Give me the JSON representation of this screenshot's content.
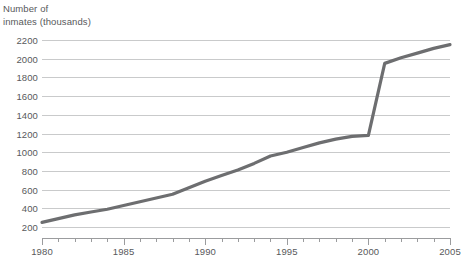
{
  "chart_data": {
    "type": "line",
    "title_line1": "Number of",
    "title_line2": "inmates (thousands)",
    "xlabel": "",
    "ylabel": "Number of inmates (thousands)",
    "xlim": [
      1980,
      2005
    ],
    "ylim": [
      150,
      2250
    ],
    "grid": true,
    "legend_position": "none",
    "line_color": "#6d6e70",
    "grid_color": "#c9cacb",
    "axis_color": "#9b9c9e",
    "text_color": "#58595b",
    "ytick_labels": [
      "2200",
      "2000",
      "1800",
      "1600",
      "1400",
      "1200",
      "1000",
      "800",
      "600",
      "400",
      "200"
    ],
    "ytick_values": [
      2200,
      2000,
      1800,
      1600,
      1400,
      1200,
      1000,
      800,
      600,
      400,
      200
    ],
    "xtick_labels": [
      "1980",
      "1985",
      "1990",
      "1995",
      "2000",
      "2005"
    ],
    "xtick_values": [
      1980,
      1985,
      1990,
      1995,
      2000,
      2005
    ],
    "xtick_minor_values": [
      1981,
      1982,
      1983,
      1984,
      1986,
      1987,
      1988,
      1989,
      1991,
      1992,
      1993,
      1994,
      1996,
      1997,
      1998,
      1999,
      2001,
      2002,
      2003,
      2004
    ],
    "x": [
      1980,
      1981,
      1982,
      1983,
      1984,
      1985,
      1986,
      1987,
      1988,
      1989,
      1990,
      1991,
      1992,
      1993,
      1994,
      1995,
      1996,
      1997,
      1998,
      1999,
      2000,
      2001,
      2002,
      2003,
      2004,
      2005
    ],
    "values": [
      250,
      290,
      330,
      360,
      390,
      430,
      470,
      510,
      550,
      620,
      690,
      750,
      810,
      880,
      960,
      1000,
      1050,
      1100,
      1140,
      1170,
      1180,
      1950,
      2010,
      2060,
      2110,
      2150
    ],
    "series": [
      {
        "name": "Number of inmates (thousands)",
        "values": [
          250,
          290,
          330,
          360,
          390,
          430,
          470,
          510,
          550,
          620,
          690,
          750,
          810,
          880,
          960,
          1000,
          1050,
          1100,
          1140,
          1170,
          1180,
          1950,
          2010,
          2060,
          2110,
          2150
        ]
      }
    ],
    "annotations": []
  }
}
